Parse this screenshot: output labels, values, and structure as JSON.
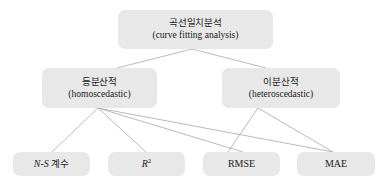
{
  "diagram": {
    "type": "hierarchy-tree",
    "title_node": {
      "ko": "곡선일치분석",
      "en": "(curve fitting analysis)"
    },
    "branches": [
      {
        "id": "homoscedastic",
        "ko": "등분산적",
        "en": "(homoscedastic)"
      },
      {
        "id": "heteroscedastic",
        "ko": "이분산적",
        "en": "(heteroscedastic)"
      }
    ],
    "metrics": [
      {
        "id": "ns",
        "label": "N-S 계수",
        "italic_part": "N-S",
        "ko_part": "계수"
      },
      {
        "id": "r2",
        "label": "R2",
        "base": "R",
        "exponent": "2"
      },
      {
        "id": "rmse",
        "label": "RMSE"
      },
      {
        "id": "mae",
        "label": "MAE"
      }
    ],
    "colors": {
      "node_fill": "#e8e8e8",
      "edge_stroke": "#a8a8a8",
      "text": "#1b1b1b",
      "background": "#ffffff"
    },
    "edges": [
      {
        "from": "curve-fitting-analysis",
        "to": "homoscedastic"
      },
      {
        "from": "curve-fitting-analysis",
        "to": "heteroscedastic"
      },
      {
        "from": "homoscedastic",
        "to": "ns"
      },
      {
        "from": "homoscedastic",
        "to": "r2"
      },
      {
        "from": "homoscedastic",
        "to": "rmse"
      },
      {
        "from": "homoscedastic",
        "to": "mae"
      },
      {
        "from": "heteroscedastic",
        "to": "rmse"
      },
      {
        "from": "heteroscedastic",
        "to": "mae"
      }
    ]
  }
}
